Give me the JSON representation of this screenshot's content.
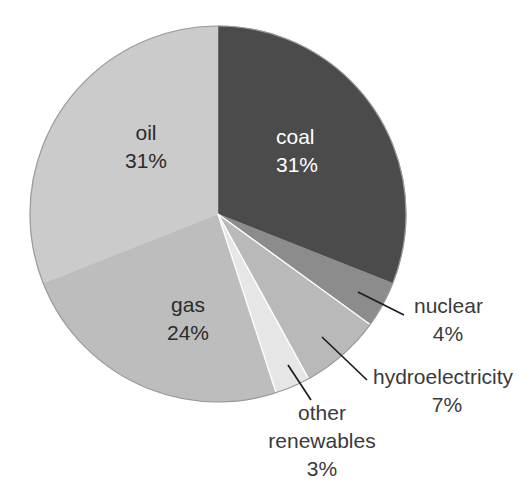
{
  "chart_data": {
    "type": "pie",
    "title": "",
    "subtitle": "",
    "xlabel": "",
    "ylabel": "",
    "legend_position": "none",
    "grid": false,
    "units": "percent",
    "start_angle_deg": 0,
    "direction": "clockwise",
    "categories": [
      "coal",
      "nuclear",
      "hydroelectricity",
      "other renewables",
      "gas",
      "oil"
    ],
    "values": [
      31,
      4,
      7,
      3,
      24,
      31
    ],
    "slices": [
      {
        "name": "coal",
        "label": "coal",
        "value": 31,
        "value_text": "31%",
        "color": "#4b4b4b",
        "label_placement": "inside",
        "label_color": "#ffffff"
      },
      {
        "name": "nuclear",
        "label": "nuclear",
        "value": 4,
        "value_text": "4%",
        "color": "#8c8c8c",
        "label_placement": "callout",
        "label_color": "#3a3a3a"
      },
      {
        "name": "hydroelectricity",
        "label": "hydroelectricity",
        "value": 7,
        "value_text": "7%",
        "color": "#b9b9b9",
        "label_placement": "callout",
        "label_color": "#3a3a3a"
      },
      {
        "name": "other renewables",
        "label": "other renewables",
        "label_line1": "other",
        "label_line2": "renewables",
        "value": 3,
        "value_text": "3%",
        "color": "#e6e6e6",
        "label_placement": "callout",
        "label_color": "#3a3a3a"
      },
      {
        "name": "gas",
        "label": "gas",
        "value": 24,
        "value_text": "24%",
        "color": "#bdbdbd",
        "label_placement": "inside",
        "label_color": "#2b2b2b"
      },
      {
        "name": "oil",
        "label": "oil",
        "value": 31,
        "value_text": "31%",
        "color": "#cbcbcb",
        "label_placement": "inside",
        "label_color": "#2b2b2b"
      }
    ],
    "background_color": "#ffffff",
    "outline_color": "#9a9a9a"
  }
}
